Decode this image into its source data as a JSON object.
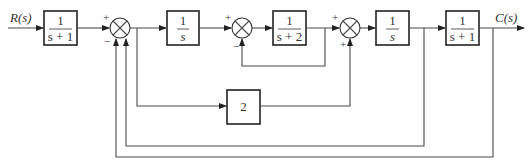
{
  "diagram": {
    "input_label": "R(s)",
    "output_label": "C(s)",
    "blocks": [
      {
        "id": "G1",
        "num": "1",
        "den": "s + 1"
      },
      {
        "id": "G2",
        "num": "1",
        "den": "s"
      },
      {
        "id": "G3",
        "num": "1",
        "den": "s + 2"
      },
      {
        "id": "G4",
        "num": "1",
        "den": "s"
      },
      {
        "id": "G5",
        "num": "1",
        "den": "s + 1"
      },
      {
        "id": "K",
        "gain": "2"
      }
    ],
    "summing_junctions": [
      {
        "id": "S1",
        "signs": {
          "left": "+",
          "bottom": "−"
        }
      },
      {
        "id": "S2",
        "signs": {
          "left": "+",
          "bottom": "−"
        }
      },
      {
        "id": "S3",
        "signs": {
          "left": "+",
          "bottom": "+"
        }
      }
    ]
  }
}
